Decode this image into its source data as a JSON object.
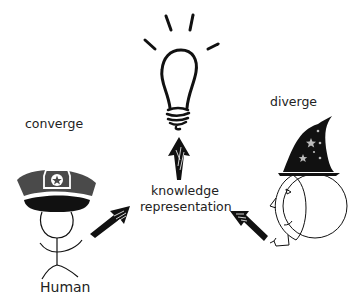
{
  "diagram": {
    "nodes": {
      "idea": {
        "icon": "lightbulb-icon"
      },
      "center": {
        "line1": "knowledge",
        "line2": "representation"
      },
      "left": {
        "caption": "converge",
        "label": "Human",
        "icon": "police-cap-stick-figure"
      },
      "right": {
        "caption": "diverge",
        "icon": "wizard-hat-face"
      }
    },
    "edges": [
      {
        "from": "Human",
        "to": "knowledge representation"
      },
      {
        "from": "wizard",
        "to": "knowledge representation"
      },
      {
        "from": "knowledge representation",
        "to": "lightbulb"
      }
    ],
    "colors": {
      "ink": "#111111",
      "cap_grey": "#4a4a4a",
      "background": "#ffffff"
    }
  }
}
